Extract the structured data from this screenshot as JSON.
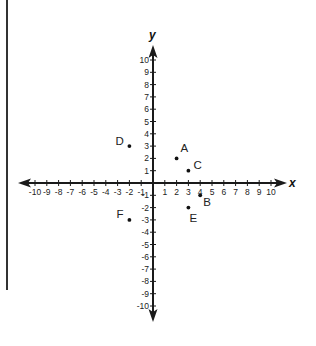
{
  "chart_data": {
    "type": "scatter",
    "title": "",
    "xlabel": "x",
    "ylabel": "y",
    "xlim": [
      -10,
      10
    ],
    "ylim": [
      -10,
      10
    ],
    "grid": false,
    "x_ticks": [
      -10,
      -9,
      -8,
      -7,
      -6,
      -5,
      -4,
      -3,
      -2,
      -1,
      1,
      2,
      3,
      4,
      5,
      6,
      7,
      8,
      9,
      10
    ],
    "y_ticks": [
      -10,
      -9,
      -8,
      -7,
      -6,
      -5,
      -4,
      -3,
      -2,
      -1,
      1,
      2,
      3,
      4,
      5,
      6,
      7,
      8,
      9,
      10
    ],
    "points": [
      {
        "label": "A",
        "x": 2,
        "y": 2,
        "label_dx": 4,
        "label_dy": -6
      },
      {
        "label": "B",
        "x": 4,
        "y": -1,
        "label_dx": 3,
        "label_dy": 11
      },
      {
        "label": "C",
        "x": 3,
        "y": 1,
        "label_dx": 5,
        "label_dy": -2
      },
      {
        "label": "D",
        "x": -2,
        "y": 3,
        "label_dx": -14,
        "label_dy": -1
      },
      {
        "label": "E",
        "x": 3,
        "y": -2,
        "label_dx": 1,
        "label_dy": 14
      },
      {
        "label": "F",
        "x": -2,
        "y": -3,
        "label_dx": -13,
        "label_dy": -2
      }
    ]
  },
  "layout": {
    "origin_x": 153,
    "origin_y": 183,
    "step_x": 11.8,
    "step_y": 12.3,
    "x_arrow_left": 18,
    "x_arrow_right": 287,
    "y_arrow_top": 45,
    "y_arrow_bottom": 322
  },
  "axis_labels": {
    "x": "x",
    "y": "y"
  }
}
